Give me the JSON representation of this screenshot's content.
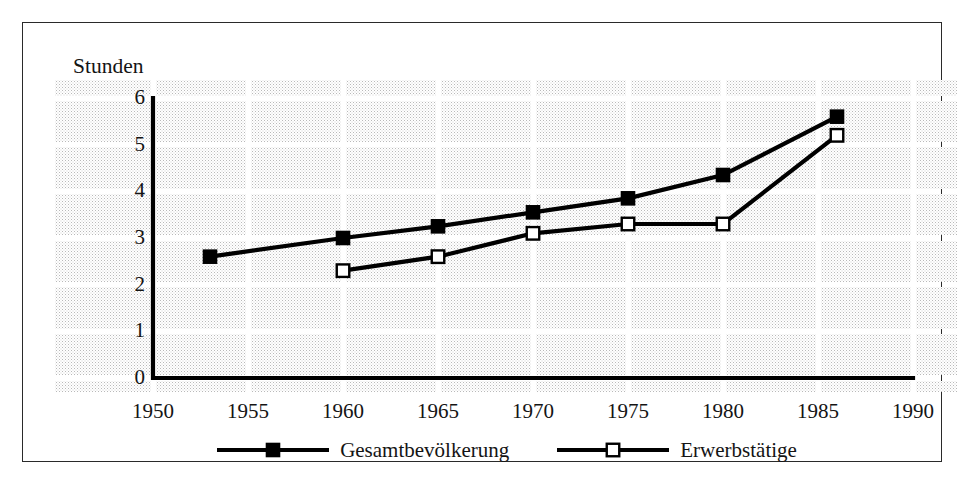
{
  "chart_data": {
    "type": "line",
    "title": "",
    "subtitle": "",
    "xlabel": "",
    "ylabel": "Stunden",
    "xlim": [
      1950,
      1990
    ],
    "ylim": [
      0,
      6
    ],
    "xticks": [
      "1950",
      "1955",
      "1960",
      "1965",
      "1970",
      "1975",
      "1980",
      "1985",
      "1990"
    ],
    "yticks": [
      "0",
      "1",
      "2",
      "3",
      "4",
      "5",
      "6"
    ],
    "grid": true,
    "legend_position": "bottom-center",
    "series": [
      {
        "name": "Gesamtbevölkerung",
        "marker": "filled-square",
        "color": "#000000",
        "x": [
          1953,
          1960,
          1965,
          1970,
          1975,
          1980,
          1986
        ],
        "values": [
          2.6,
          3.0,
          3.25,
          3.55,
          3.85,
          4.35,
          5.6
        ]
      },
      {
        "name": "Erwerbstätige",
        "marker": "hollow-square",
        "color": "#000000",
        "x": [
          1960,
          1965,
          1970,
          1975,
          1980,
          1986
        ],
        "values": [
          2.3,
          2.6,
          3.1,
          3.3,
          3.3,
          5.2
        ]
      }
    ]
  },
  "axis": {
    "y_title": "Stunden"
  },
  "legend": {
    "entries": [
      {
        "label": "Gesamtbevölkerung",
        "marker": "filled-square"
      },
      {
        "label": "Erwerbstätige",
        "marker": "hollow-square"
      }
    ]
  },
  "colors": {
    "ink": "#000000",
    "frame": "#2a2a2a",
    "gridline": "#ffffff",
    "halftone_dark": "#b9b9b9",
    "halftone_light": "#cfcfcf",
    "paper": "#ffffff"
  }
}
